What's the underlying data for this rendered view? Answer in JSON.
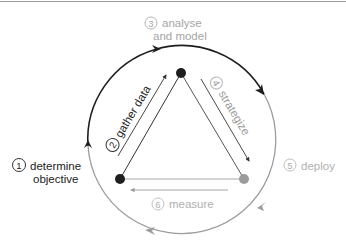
{
  "colors": {
    "dark": "#1e1e1e",
    "gray": "#9c9c9c",
    "mid": "#444444"
  },
  "steps": [
    {
      "number": "1",
      "label_line1": "determine",
      "label_line2": "objective"
    },
    {
      "number": "2",
      "label": "gather data"
    },
    {
      "number": "3",
      "label_line1": "analyse",
      "label_line2": "and model"
    },
    {
      "number": "4",
      "label": "strategize"
    },
    {
      "number": "5",
      "label": "deploy"
    },
    {
      "number": "6",
      "label": "measure"
    }
  ]
}
